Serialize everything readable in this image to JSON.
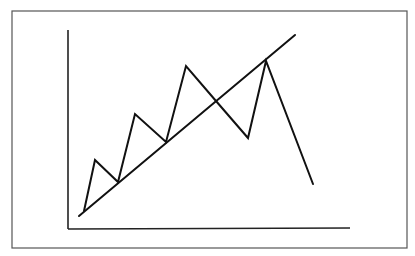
{
  "diagram": {
    "type": "trendline-breakdown",
    "colors": {
      "background": "#ffffff",
      "frame": "#555555",
      "axes": "#222222",
      "lines": "#111111"
    },
    "frame": {
      "x": 12,
      "y": 11,
      "width": 395,
      "height": 237
    },
    "y_axis": {
      "x1": 68,
      "y1": 30,
      "x2": 68,
      "y2": 229
    },
    "x_axis": {
      "x1": 68,
      "y1": 229,
      "x2": 350,
      "y2": 228
    },
    "trendline": {
      "x1": 79,
      "y1": 216,
      "x2": 295,
      "y2": 35
    },
    "price_path": [
      [
        84,
        211
      ],
      [
        95,
        160
      ],
      [
        118,
        182
      ],
      [
        135,
        114
      ],
      [
        166,
        142
      ],
      [
        186,
        66
      ],
      [
        216,
        101
      ],
      [
        248,
        138
      ],
      [
        266,
        61
      ],
      [
        313,
        184
      ]
    ]
  },
  "chart_data": {
    "type": "line",
    "title": "",
    "xlabel": "",
    "ylabel": "",
    "series": [
      {
        "name": "price",
        "x": [
          0,
          1,
          2,
          3,
          4,
          5,
          6,
          7,
          8,
          9
        ],
        "values": [
          5,
          69,
          34,
          118,
          83,
          182,
          137,
          90,
          193,
          40
        ]
      },
      {
        "name": "trendline",
        "x": [
          0,
          9
        ],
        "values": [
          0,
          230
        ]
      }
    ],
    "grid": false,
    "legend": "none"
  }
}
